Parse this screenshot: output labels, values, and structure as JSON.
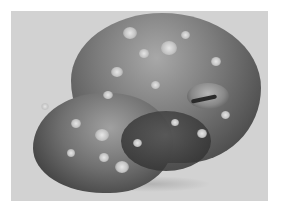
{
  "image": {
    "subject": "specimen-photograph",
    "style": "grayscale",
    "background_color": "#d2d2d2",
    "page_color": "#ffffff"
  },
  "caption": {
    "text": "",
    "visible": "partially cut off at bottom edge, illegible"
  }
}
